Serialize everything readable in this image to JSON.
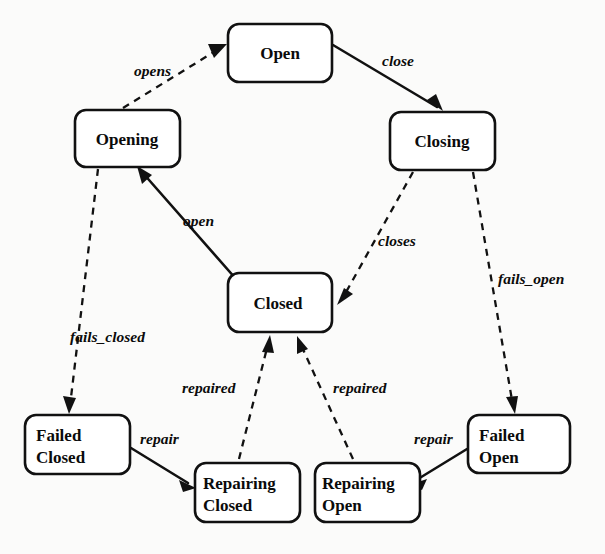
{
  "diagram": {
    "type": "state-transition-diagram",
    "background_color": "#fbfbfa",
    "ink_color": "#111111",
    "nodes": [
      {
        "id": "open",
        "label": "Open",
        "lines": [
          "Open"
        ],
        "x": 228,
        "y": 24,
        "w": 104,
        "h": 58
      },
      {
        "id": "opening",
        "label": "Opening",
        "lines": [
          "Opening"
        ],
        "x": 75,
        "y": 110,
        "w": 105,
        "h": 57
      },
      {
        "id": "closing",
        "label": "Closing",
        "lines": [
          "Closing"
        ],
        "x": 390,
        "y": 112,
        "w": 105,
        "h": 58
      },
      {
        "id": "closed",
        "label": "Closed",
        "lines": [
          "Closed"
        ],
        "x": 228,
        "y": 273,
        "w": 104,
        "h": 59
      },
      {
        "id": "failed_closed",
        "label": "Failed Closed",
        "lines": [
          "Failed",
          "Closed"
        ],
        "x": 25,
        "y": 415,
        "w": 105,
        "h": 59
      },
      {
        "id": "repairing_closed",
        "label": "Repairing Closed",
        "lines": [
          "Repairing",
          "Closed"
        ],
        "x": 195,
        "y": 463,
        "w": 105,
        "h": 59
      },
      {
        "id": "repairing_open",
        "label": "Repairing Open",
        "lines": [
          "Repairing",
          "Open"
        ],
        "x": 315,
        "y": 463,
        "w": 105,
        "h": 59
      },
      {
        "id": "failed_open",
        "label": "Failed Open",
        "lines": [
          "Failed",
          "Open"
        ],
        "x": 468,
        "y": 415,
        "w": 102,
        "h": 58
      }
    ],
    "edges": [
      {
        "id": "opening-opens-open",
        "label": "opens",
        "from": "opening",
        "to": "open",
        "style": "dashed",
        "label_x": 134,
        "label_y": 76
      },
      {
        "id": "open-close-closing",
        "label": "close",
        "from": "open",
        "to": "closing",
        "style": "solid",
        "label_x": 382,
        "label_y": 66
      },
      {
        "id": "closed-open-opening",
        "label": "open",
        "from": "closed",
        "to": "opening",
        "style": "solid",
        "label_x": 183,
        "label_y": 226
      },
      {
        "id": "closing-closes-closed",
        "label": "closes",
        "from": "closing",
        "to": "closed",
        "style": "dashed",
        "label_x": 378,
        "label_y": 246
      },
      {
        "id": "closing-fails_open-failed_open",
        "label": "fails_open",
        "from": "closing",
        "to": "failed_open",
        "style": "dashed",
        "label_x": 498,
        "label_y": 284
      },
      {
        "id": "opening-fails_closed-failed_closed",
        "label": "fails_closed",
        "from": "opening",
        "to": "failed_closed",
        "style": "dashed",
        "label_x": 70,
        "label_y": 342
      },
      {
        "id": "failed_closed-repair-repairing_closed",
        "label": "repair",
        "from": "failed_closed",
        "to": "repairing_closed",
        "style": "solid",
        "label_x": 140,
        "label_y": 444
      },
      {
        "id": "repairing_closed-repaired-closed",
        "label": "repaired",
        "from": "repairing_closed",
        "to": "closed",
        "style": "dashed",
        "label_x": 182,
        "label_y": 393
      },
      {
        "id": "repairing_open-repaired-closed",
        "label": "repaired",
        "from": "repairing_open",
        "to": "closed",
        "style": "dashed",
        "label_x": 333,
        "label_y": 393
      },
      {
        "id": "failed_open-repair-repairing_open",
        "label": "repair",
        "from": "failed_open",
        "to": "repairing_open",
        "style": "solid",
        "label_x": 414,
        "label_y": 444
      }
    ]
  }
}
